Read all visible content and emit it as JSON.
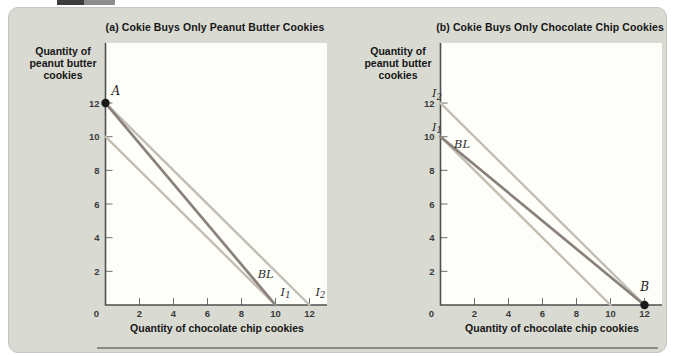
{
  "figure": {
    "panel_bg": "#d9dbd3",
    "plot_bg": "#fdfdfa",
    "rule_color": "#8b8b8b"
  },
  "colors": {
    "budget_line": "#8a817a",
    "indifference_curve": "#c4beb2",
    "axis": "#4f4f4f",
    "tick": "#6e6e6e",
    "tick_label": "#3a3a3a",
    "curve_label": "#2f2f2f",
    "point": "#1a1a1a"
  },
  "chart_data": [
    {
      "type": "line",
      "panel": "a",
      "title": "(a) Cokie Buys Only Peanut Butter Cookies",
      "xlabel": "Quantity of chocolate chip cookies",
      "ylabel": "Quantity of peanut butter cookies",
      "ylabel_lines": [
        "Quantity of",
        "peanut butter",
        "cookies"
      ],
      "xlim": [
        0,
        13
      ],
      "ylim": [
        0,
        15.5
      ],
      "grid": false,
      "xticks": [
        0,
        2,
        4,
        6,
        8,
        10,
        12
      ],
      "yticks": [
        2,
        4,
        6,
        8,
        10,
        12
      ],
      "series": [
        {
          "name": "BL",
          "role": "budget-line",
          "label": "BL",
          "sub": "",
          "points": [
            [
              0,
              12
            ],
            [
              10,
              0
            ]
          ],
          "label_at": [
            8.95,
            1.6
          ]
        },
        {
          "name": "I1",
          "role": "indifference-curve",
          "label": "I",
          "sub": "1",
          "points": [
            [
              0,
              10
            ],
            [
              10,
              0
            ]
          ],
          "label_at": [
            10.3,
            0.55
          ]
        },
        {
          "name": "I2",
          "role": "indifference-curve",
          "label": "I",
          "sub": "2",
          "points": [
            [
              0,
              12
            ],
            [
              12,
              0
            ]
          ],
          "label_at": [
            12.35,
            0.55
          ]
        }
      ],
      "markers": [
        {
          "label": "A",
          "at": [
            0,
            12
          ],
          "label_at": [
            0.35,
            12.45
          ]
        }
      ]
    },
    {
      "type": "line",
      "panel": "b",
      "title": "(b) Cokie Buys Only Chocolate Chip Cookies",
      "xlabel": "Quantity of chocolate chip cookies",
      "ylabel": "Quantity of peanut butter cookies",
      "ylabel_lines": [
        "Quantity of",
        "peanut butter",
        "cookies"
      ],
      "xlim": [
        0,
        13
      ],
      "ylim": [
        0,
        15.5
      ],
      "grid": false,
      "xticks": [
        0,
        2,
        4,
        6,
        8,
        10,
        12
      ],
      "yticks": [
        2,
        4,
        6,
        8,
        10,
        12
      ],
      "series": [
        {
          "name": "BL",
          "role": "budget-line",
          "label": "BL",
          "sub": "",
          "points": [
            [
              0,
              10
            ],
            [
              12,
              0
            ]
          ],
          "label_at": [
            0.8,
            9.3
          ]
        },
        {
          "name": "I1",
          "role": "indifference-curve",
          "label": "I",
          "sub": "1",
          "points": [
            [
              0,
              10
            ],
            [
              10,
              0
            ]
          ],
          "label_at": [
            -0.5,
            10.35
          ]
        },
        {
          "name": "I2",
          "role": "indifference-curve",
          "label": "I",
          "sub": "2",
          "points": [
            [
              0,
              12
            ],
            [
              12,
              0
            ]
          ],
          "label_at": [
            -0.5,
            12.35
          ]
        }
      ],
      "markers": [
        {
          "label": "B",
          "at": [
            12,
            0
          ],
          "label_at": [
            11.75,
            0.85
          ]
        }
      ]
    }
  ]
}
